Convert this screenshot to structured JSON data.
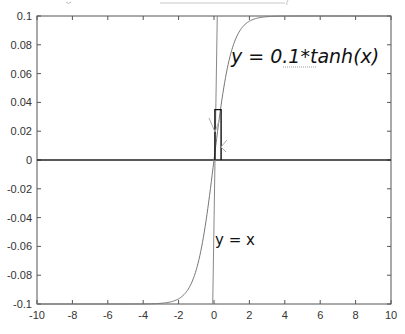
{
  "chart_data": {
    "type": "line",
    "title": "",
    "xlabel": "",
    "ylabel": "",
    "xlim": [
      -10,
      10
    ],
    "ylim": [
      -0.1,
      0.1
    ],
    "x_ticks": [
      -10,
      -8,
      -6,
      -4,
      -2,
      0,
      2,
      4,
      6,
      8,
      10
    ],
    "x_tick_labels": [
      "-10",
      "-8",
      "-6",
      "-4",
      "-2",
      "0",
      "2",
      "4",
      "6",
      "8",
      "10"
    ],
    "y_ticks": [
      0.1,
      0.08,
      0.06,
      0.04,
      0.02,
      0,
      -0.02,
      -0.04,
      -0.06,
      -0.08,
      -0.1
    ],
    "y_tick_labels": [
      "0.1",
      "0.08",
      "0.06",
      "0.04",
      "0.02",
      "0",
      "-0.02",
      "-0.04",
      "-0.06",
      "-0.08",
      "-0.1"
    ],
    "grid": false,
    "legend": null,
    "series": [
      {
        "name": "y = 0.1*tanh(x)",
        "function": "0.1*tanh(x)",
        "color": "#777777"
      },
      {
        "name": "y = x",
        "function": "x",
        "color": "#888888"
      },
      {
        "name": "y = 0",
        "function": "0",
        "color": "#222222"
      }
    ],
    "cobweb": {
      "color": "#111111",
      "points": [
        [
          0.4,
          0
        ],
        [
          0.4,
          0.035
        ],
        [
          0.05,
          0.035
        ],
        [
          0.05,
          0
        ]
      ]
    },
    "annotations": [
      {
        "text": "y = 0.1*tanh(x)",
        "x": 1.9,
        "y": 0.075
      },
      {
        "text": "y = x",
        "x": 0.1,
        "y": -0.062
      }
    ]
  },
  "labels": {
    "tanh_label": "y = 0.1*tanh(x)",
    "yx_label": "y = x"
  }
}
